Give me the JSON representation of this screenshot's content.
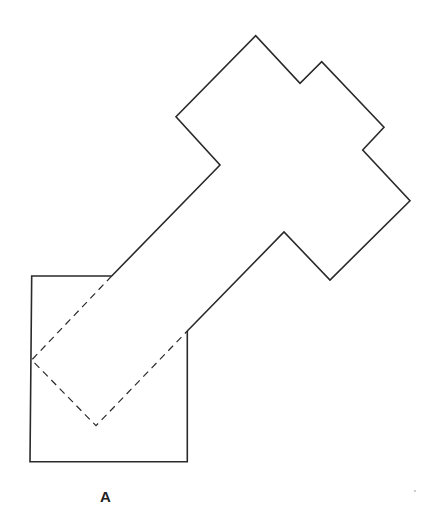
{
  "figure": {
    "label": "A",
    "colors": {
      "stroke": "#2a2a2a",
      "background": "#ffffff"
    },
    "shapes": {
      "square": {
        "description": "Square outline partially overlapped by a rotated figure",
        "points": "31.7,276 111.7,276 M187.3,331 187.3,461.7 30,461.7 31.7,276"
      },
      "rotated_figure": {
        "description": "Rotated T/cross-shaped outline extending up-right from the square",
        "outline": "111.7,276 220,165 176,116.7 255.7,35.7 300,83.3 321.7,61.7 384,127.3 362.7,150 410,200.7 330,280 284,232 187.3,331",
        "hidden_edges": "111.7,276 31.7,360 96,425.7 187.3,331"
      }
    }
  }
}
